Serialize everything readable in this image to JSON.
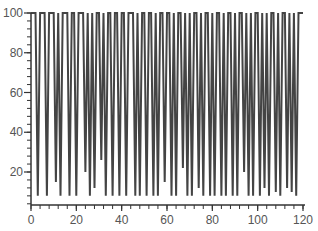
{
  "chart_data": {
    "type": "line",
    "title": "",
    "xlabel": "",
    "ylabel": "",
    "xlim": [
      0,
      120
    ],
    "ylim": [
      3,
      100
    ],
    "grid": false,
    "legend": null,
    "x_ticks": [
      0,
      20,
      40,
      60,
      80,
      100,
      120
    ],
    "x_tick_labels": [
      "0",
      "20",
      "40",
      "60",
      "80",
      "100",
      "120"
    ],
    "y_ticks": [
      20,
      40,
      60,
      80,
      100
    ],
    "y_tick_labels": [
      "20",
      "40",
      "60",
      "80",
      "100"
    ],
    "series": [
      {
        "name": "series1",
        "color": "#444444",
        "x": [
          0,
          1,
          2,
          3,
          4,
          5,
          6,
          7,
          8,
          9,
          10,
          11,
          12,
          13,
          14,
          15,
          16,
          17,
          18,
          19,
          20,
          21,
          22,
          23,
          24,
          25,
          26,
          27,
          28,
          29,
          30,
          31,
          32,
          33,
          34,
          35,
          36,
          37,
          38,
          39,
          40,
          41,
          42,
          43,
          44,
          45,
          46,
          47,
          48,
          49,
          50,
          51,
          52,
          53,
          54,
          55,
          56,
          57,
          58,
          59,
          60,
          61,
          62,
          63,
          64,
          65,
          66,
          67,
          68,
          69,
          70,
          71,
          72,
          73,
          74,
          75,
          76,
          77,
          78,
          79,
          80,
          81,
          82,
          83,
          84,
          85,
          86,
          87,
          88,
          89,
          90,
          91,
          92,
          93,
          94,
          95,
          96,
          97,
          98,
          99,
          100,
          101,
          102,
          103,
          104,
          105,
          106,
          107,
          108,
          109,
          110,
          111,
          112,
          113,
          114,
          115,
          116,
          117,
          118,
          119,
          120
        ],
        "y": [
          100,
          100,
          100,
          8,
          100,
          100,
          100,
          8,
          100,
          100,
          100,
          15,
          100,
          8,
          100,
          100,
          100,
          8,
          100,
          100,
          8,
          100,
          100,
          100,
          20,
          100,
          8,
          100,
          12,
          100,
          100,
          26,
          100,
          8,
          100,
          100,
          8,
          100,
          100,
          8,
          100,
          100,
          8,
          100,
          100,
          100,
          8,
          100,
          8,
          100,
          100,
          8,
          100,
          100,
          8,
          100,
          8,
          100,
          100,
          15,
          100,
          100,
          8,
          100,
          8,
          100,
          100,
          22,
          100,
          8,
          100,
          8,
          100,
          100,
          12,
          100,
          8,
          100,
          100,
          8,
          100,
          8,
          100,
          100,
          8,
          100,
          8,
          100,
          100,
          8,
          100,
          8,
          100,
          100,
          20,
          100,
          8,
          100,
          8,
          100,
          100,
          8,
          100,
          12,
          100,
          8,
          100,
          100,
          10,
          100,
          8,
          100,
          100,
          12,
          100,
          10,
          100,
          8,
          100,
          100,
          100
        ]
      }
    ]
  }
}
